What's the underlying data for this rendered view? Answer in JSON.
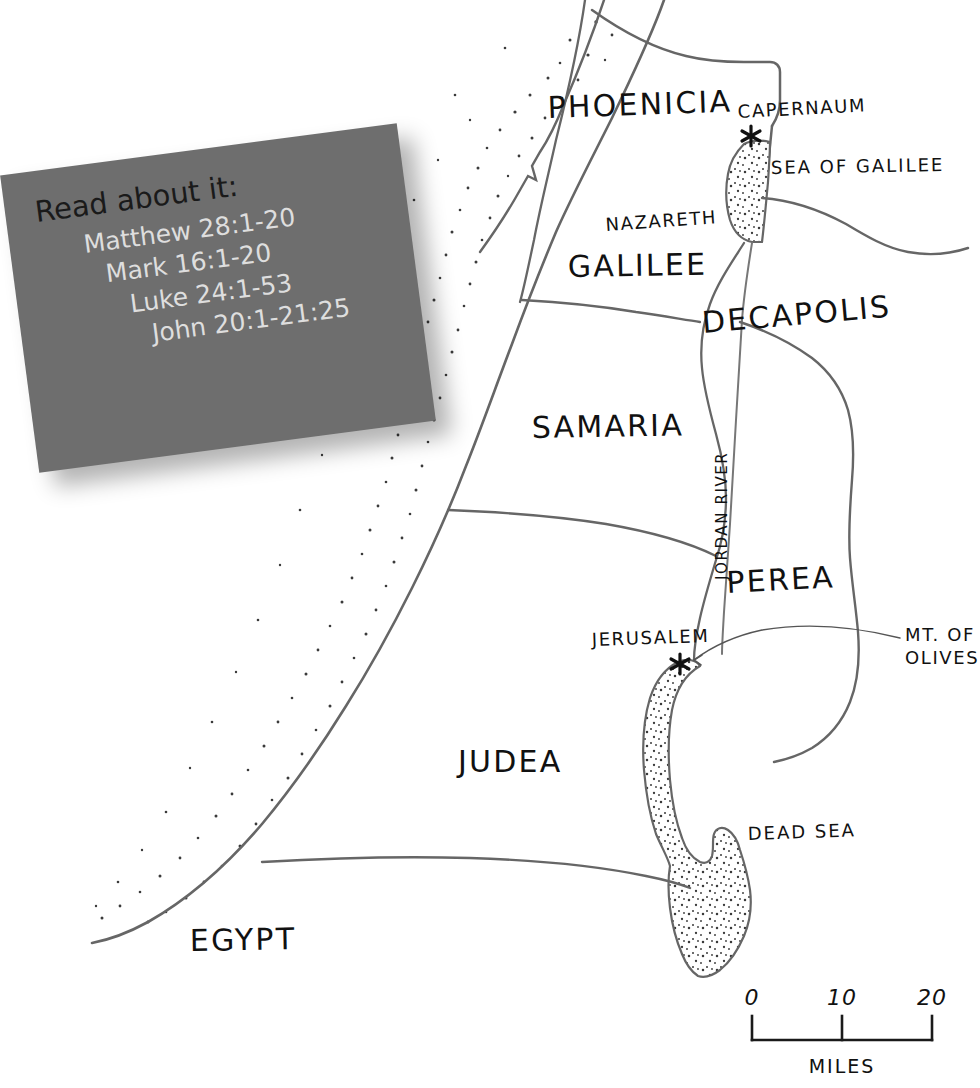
{
  "map": {
    "title": "Map of First-Century Palestine",
    "regions": [
      {
        "name": "PHOENICIA",
        "x": 548,
        "y": 118,
        "size": 31,
        "rotate": -2
      },
      {
        "name": "GALILEE",
        "x": 568,
        "y": 277,
        "size": 31,
        "rotate": -1
      },
      {
        "name": "DECAPOLIS",
        "x": 703,
        "y": 333,
        "size": 31,
        "rotate": -5
      },
      {
        "name": "SAMARIA",
        "x": 532,
        "y": 438,
        "size": 31,
        "rotate": -1
      },
      {
        "name": "PEREA",
        "x": 727,
        "y": 593,
        "size": 31,
        "rotate": -3
      },
      {
        "name": "JUDEA",
        "x": 458,
        "y": 772,
        "size": 31,
        "rotate": 0
      },
      {
        "name": "EGYPT",
        "x": 190,
        "y": 951,
        "size": 31,
        "rotate": -1
      }
    ],
    "cities": [
      {
        "name": "CAPERNAUM",
        "label_x": 738,
        "label_y": 118,
        "marker_x": 751,
        "marker_y": 136,
        "marker": "asterisk"
      },
      {
        "name": "NAZARETH",
        "label_x": 606,
        "label_y": 231,
        "marker": "none"
      },
      {
        "name": "JERUSALEM",
        "label_x": 592,
        "label_y": 646,
        "marker_x": 680,
        "marker_y": 664,
        "marker": "asterisk"
      }
    ],
    "water_features": [
      {
        "name": "SEA OF GALILEE",
        "label_x": 771,
        "label_y": 174
      },
      {
        "name": "DEAD SEA",
        "label_x": 748,
        "label_y": 840
      }
    ],
    "rivers": [
      {
        "name": "JORDAN RIVER",
        "label_x": 727,
        "label_y": 580,
        "rotation": -90
      }
    ],
    "landmarks": [
      {
        "name_line1": "MT. OF",
        "name_line2": "OLIVES",
        "label_x": 905,
        "label_y": 641,
        "has_leader_line": true
      }
    ],
    "scale_bar": {
      "ticks": [
        "0",
        "10",
        "20"
      ],
      "unit_label": "MILES",
      "tick_x": [
        752,
        841,
        932
      ],
      "label_y": 1005,
      "bar_y": 1040,
      "unit_x": 842,
      "unit_y": 1073
    }
  },
  "note_card": {
    "title": "Read about it:",
    "references": [
      "Matthew 28:1-20",
      "Mark 16:1-20",
      "Luke 24:1-53",
      "John 20:1-21:25"
    ],
    "background_color": "#6e6e6e",
    "title_color": "#1a1a1a",
    "reference_color": "#dedede"
  },
  "colors": {
    "ink": "#555555",
    "label_ink": "#111111",
    "page_background": "#ffffff",
    "stipple": "#333333"
  }
}
